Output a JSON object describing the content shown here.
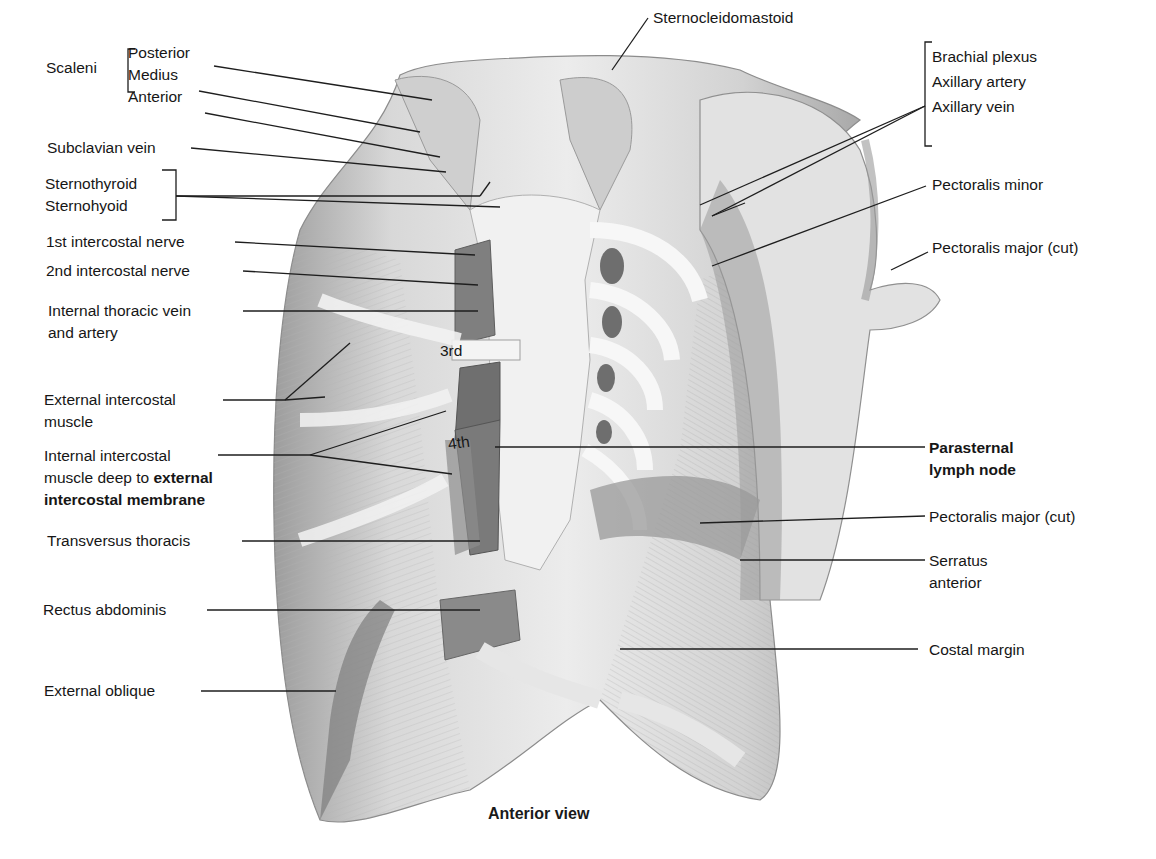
{
  "figure": {
    "caption": "Anterior view",
    "left_labels": {
      "scaleni_group": "Scaleni",
      "scaleni_posterior": "Posterior",
      "scaleni_medius": "Medius",
      "scaleni_anterior": "Anterior",
      "subclavian_vein": "Subclavian vein",
      "sternothyroid": "Sternothyroid",
      "sternohyoid": "Sternohyoid",
      "first_intercostal_nerve": "1st intercostal nerve",
      "second_intercostal_nerve": "2nd intercostal nerve",
      "internal_thoracic_line1": "Internal thoracic vein",
      "internal_thoracic_line2": "and artery",
      "external_intercostal_line1": "External intercostal",
      "external_intercostal_line2": "muscle",
      "internal_intercostal_line1": "Internal intercostal",
      "internal_intercostal_line2a": "muscle deep to ",
      "internal_intercostal_line2b": "external",
      "internal_intercostal_line3": "intercostal membrane",
      "transversus_thoracis": "Transversus thoracis",
      "rectus_abdominis": "Rectus abdominis",
      "external_oblique": "External oblique"
    },
    "top_labels": {
      "sternocleidomastoid": "Sternocleidomastoid"
    },
    "right_labels": {
      "brachial_plexus": "Brachial plexus",
      "axillary_artery": "Axillary artery",
      "axillary_vein": "Axillary vein",
      "pectoralis_minor": "Pectoralis minor",
      "pectoralis_major_cut_upper": "Pectoralis major (cut)",
      "parasternal_line1": "Parasternal",
      "parasternal_line2": "lymph node",
      "pectoralis_major_cut_lower": "Pectoralis major (cut)",
      "serratus_line1": "Serratus",
      "serratus_line2": "anterior",
      "costal_margin": "Costal margin"
    },
    "inline_labels": {
      "rib_3": "3rd",
      "rib_4": "4th"
    },
    "colors": {
      "background": "#ffffff",
      "text": "#161616",
      "leader": "#1e1e1e",
      "muscle_light": "#e6e6e6",
      "muscle_mid": "#bdbdbd",
      "muscle_dark": "#8a8a8a",
      "sternum": "#efefef"
    }
  }
}
